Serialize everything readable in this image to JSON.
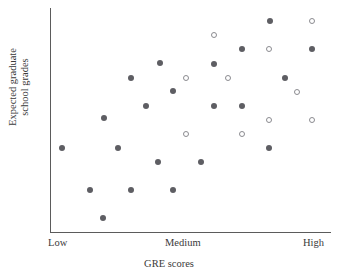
{
  "chart_data": {
    "type": "scatter",
    "title": "",
    "xlabel": "GRE scores",
    "ylabel_line1": "Expected graduate",
    "ylabel_line2": "school grades",
    "xtick_labels": [
      "Low",
      "Medium",
      "High"
    ],
    "ytick_labels": [],
    "grid": false,
    "legend": "none",
    "xlim": [
      0,
      100
    ],
    "ylim": [
      0,
      100
    ],
    "marker_colors": {
      "filled": "#5e5e63",
      "open_stroke": "#8b8b90",
      "open_fill": "#ffffff",
      "axis": "#5b5b5b"
    },
    "series": [
      {
        "name": "filled",
        "marker": "filled-circle",
        "points": [
          {
            "x": 78.3,
            "y": 94.2
          },
          {
            "x": 68.3,
            "y": 81.7
          },
          {
            "x": 93.2,
            "y": 81.7
          },
          {
            "x": 39.1,
            "y": 75.4
          },
          {
            "x": 58.4,
            "y": 75.0
          },
          {
            "x": 28.8,
            "y": 68.8
          },
          {
            "x": 83.6,
            "y": 68.8
          },
          {
            "x": 43.8,
            "y": 63.0
          },
          {
            "x": 34.2,
            "y": 56.3
          },
          {
            "x": 58.4,
            "y": 56.3
          },
          {
            "x": 68.3,
            "y": 56.3
          },
          {
            "x": 19.2,
            "y": 50.9
          },
          {
            "x": 4.3,
            "y": 37.5
          },
          {
            "x": 24.2,
            "y": 37.5
          },
          {
            "x": 77.9,
            "y": 37.5
          },
          {
            "x": 38.4,
            "y": 31.3
          },
          {
            "x": 53.7,
            "y": 31.3
          },
          {
            "x": 14.2,
            "y": 18.8
          },
          {
            "x": 28.8,
            "y": 18.8
          },
          {
            "x": 43.8,
            "y": 18.8
          },
          {
            "x": 18.9,
            "y": 6.3
          }
        ]
      },
      {
        "name": "open",
        "marker": "open-circle",
        "points": [
          {
            "x": 93.2,
            "y": 94.2
          },
          {
            "x": 58.4,
            "y": 88.0
          },
          {
            "x": 77.9,
            "y": 81.7
          },
          {
            "x": 48.4,
            "y": 68.8
          },
          {
            "x": 63.3,
            "y": 68.8
          },
          {
            "x": 87.9,
            "y": 62.5
          },
          {
            "x": 77.9,
            "y": 50.0
          },
          {
            "x": 93.2,
            "y": 50.0
          },
          {
            "x": 48.4,
            "y": 43.8
          },
          {
            "x": 68.3,
            "y": 43.8
          }
        ]
      }
    ]
  }
}
